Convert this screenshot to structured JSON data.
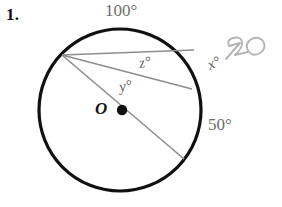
{
  "problem": {
    "number": "1."
  },
  "figure": {
    "type": "circle-geometry-diagram",
    "center_label": "O",
    "labels": {
      "arc_top": "100°",
      "arc_bottom_right": "50°",
      "angle_x": "x°",
      "angle_y": "y°",
      "angle_z": "z°"
    },
    "handwritten_annotation": "30",
    "colors": {
      "circle_stroke": "#111111",
      "chord_stroke": "#8d8d8d",
      "label_text": "#6d6d6d",
      "dark_text": "#121212",
      "handwriting": "#b0b0b0"
    },
    "geometry": {
      "circle": {
        "cx": 120,
        "cy": 110,
        "r": 81
      },
      "center_dot": {
        "cx": 122,
        "cy": 110,
        "r": 5
      },
      "vertex": {
        "x": 62,
        "y": 55
      },
      "chord_upper_end": {
        "x": 194,
        "y": 50
      },
      "chord_lower_end": {
        "x": 192,
        "y": 89
      },
      "diameter_end": {
        "x": 184,
        "y": 159
      }
    }
  }
}
